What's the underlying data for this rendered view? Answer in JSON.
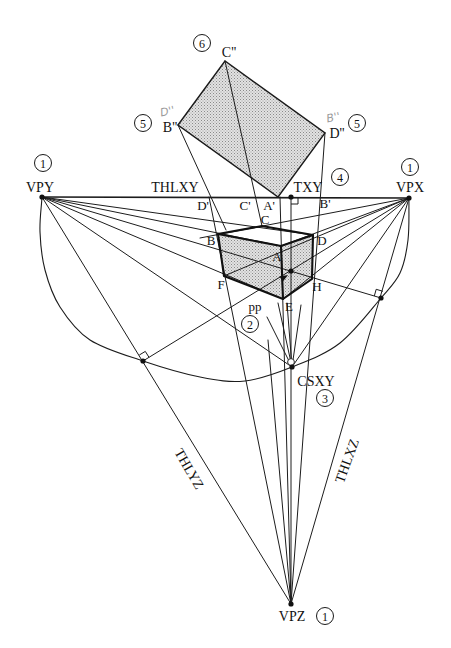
{
  "figure": {
    "vanishing_points": {
      "vpy": "VPY",
      "vpx": "VPX",
      "vpz": "VPZ"
    },
    "trace_lines": {
      "thlxy": "THLXY",
      "thlyz": "THLYZ",
      "thlxz": "THLXZ"
    },
    "special_points": {
      "txy": "TXY",
      "csxy": "CSXY",
      "pp": "pp"
    },
    "rotated_plane": {
      "c2": "C''",
      "b2": "B''",
      "d2": "D''",
      "b2_handwritten_note": "D''",
      "d2_handwritten_note": "B''"
    },
    "horizon_points": {
      "d1": "D'",
      "c1": "C'",
      "a1": "A'",
      "b1": "B'"
    },
    "box_corners": {
      "a": "A",
      "b": "B",
      "c": "C",
      "d": "D",
      "e": "E",
      "f": "F",
      "h": "H"
    },
    "steps": {
      "vpy": "1",
      "vpx": "1",
      "vpz": "1",
      "pp": "2",
      "csxy": "3",
      "txy": "4",
      "b2": "5",
      "d2": "5",
      "c2": "6"
    }
  },
  "colors": {
    "ink": "#1c1c1c",
    "shade": "#d6d6d6",
    "handwriting": "#9a9a9a"
  }
}
